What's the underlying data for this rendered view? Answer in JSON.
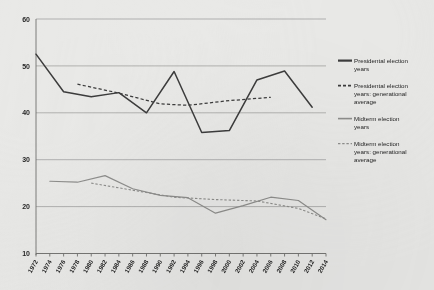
{
  "chart_data": {
    "type": "line",
    "title": "",
    "subtitle": "",
    "xlabel": "",
    "ylabel": "",
    "xlim": [
      1972,
      2014
    ],
    "ylim": [
      10,
      60
    ],
    "ytick_step": 10,
    "xtick_step": 2,
    "grid": "horizontal",
    "legend_position": "right",
    "yticks": [
      "60",
      "50",
      "40",
      "30",
      "20",
      "10"
    ],
    "ytick_values": [
      60,
      50,
      40,
      30,
      20,
      10
    ],
    "categories": [
      "1972",
      "1974",
      "1976",
      "1978",
      "1980",
      "1982",
      "1984",
      "1986",
      "1988",
      "1990",
      "1992",
      "1994",
      "1996",
      "1998",
      "2000",
      "2002",
      "2004",
      "2006",
      "2008",
      "2010",
      "2012",
      "2014"
    ],
    "series": [
      {
        "name": "Presidental election years",
        "style": "solid",
        "color": "#3c3c3c",
        "x": [
          1972,
          1976,
          1980,
          1984,
          1988,
          1992,
          1996,
          2000,
          2004,
          2008,
          2012
        ],
        "values": [
          52.5,
          44.5,
          43.4,
          44.3,
          40.0,
          48.8,
          35.8,
          36.2,
          47.0,
          48.9,
          41.2
        ]
      },
      {
        "name": "Presidental election years: generational average",
        "style": "dashed",
        "color": "#3c3c3c",
        "x": [
          1978,
          1984,
          1990,
          1994,
          2000,
          2006
        ],
        "values": [
          46.1,
          44.2,
          41.9,
          41.6,
          42.6,
          43.3
        ]
      },
      {
        "name": "Midterm election years",
        "style": "solid",
        "color": "#8e8e8c",
        "x": [
          1974,
          1978,
          1982,
          1986,
          1990,
          1994,
          1998,
          2002,
          2006,
          2010,
          2014
        ],
        "values": [
          25.4,
          25.2,
          26.6,
          23.8,
          22.4,
          21.9,
          18.6,
          20.2,
          22.0,
          21.3,
          17.2
        ]
      },
      {
        "name": "Midterm election years: generational average",
        "style": "dashed",
        "color": "#8e8e8c",
        "x": [
          1980,
          1986,
          1992,
          1998,
          2004,
          2010,
          2014
        ],
        "values": [
          25.0,
          23.5,
          22.0,
          21.5,
          21.2,
          19.6,
          17.4
        ]
      }
    ]
  },
  "legend": {
    "items": [
      {
        "label_line1": "Presidental election",
        "label_line2": "years",
        "label_line3": "",
        "swatch": "solid-dark-line-icon"
      },
      {
        "label_line1": "Presidental election",
        "label_line2": "years: generational",
        "label_line3": "average",
        "swatch": "dashed-dark-line-icon"
      },
      {
        "label_line1": "Midterm election",
        "label_line2": "years",
        "label_line3": "",
        "swatch": "solid-grey-line-icon"
      },
      {
        "label_line1": "Midterm election",
        "label_line2": "years: generational",
        "label_line3": "average",
        "swatch": "dashed-grey-line-icon"
      }
    ]
  },
  "colors": {
    "background": "#e9e9e7",
    "grid": "#9a9a98",
    "axis": "#6f6f6d",
    "presidential": "#3c3c3c",
    "midterm": "#8e8e8c"
  }
}
